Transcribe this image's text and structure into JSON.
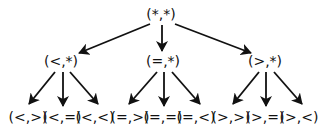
{
  "diagram": {
    "type": "tree",
    "colors": {
      "stroke": "#111111",
      "text": "#111111",
      "background": "#ffffff"
    },
    "nodes": [
      {
        "id": "root",
        "label": "(*,*)",
        "x": 161,
        "y": 15
      },
      {
        "id": "lt",
        "label": "(<,*)",
        "x": 61,
        "y": 62
      },
      {
        "id": "eq",
        "label": "(=,*)",
        "x": 163,
        "y": 62
      },
      {
        "id": "gt",
        "label": "(>,*)",
        "x": 265,
        "y": 62
      },
      {
        "id": "lt_gt",
        "label": "(<,>)",
        "x": 28,
        "y": 118
      },
      {
        "id": "lt_eq",
        "label": "(<,=)",
        "x": 62,
        "y": 118
      },
      {
        "id": "lt_lt",
        "label": "(<,<)",
        "x": 95,
        "y": 118
      },
      {
        "id": "eq_gt",
        "label": "(=,>)",
        "x": 130,
        "y": 118
      },
      {
        "id": "eq_eq",
        "label": "(=,=)",
        "x": 163,
        "y": 118
      },
      {
        "id": "eq_lt",
        "label": "(=,<)",
        "x": 196,
        "y": 118
      },
      {
        "id": "gt_gt",
        "label": "(>,>)",
        "x": 231,
        "y": 118
      },
      {
        "id": "gt_eq",
        "label": "(>,=)",
        "x": 265,
        "y": 118
      },
      {
        "id": "gt_lt",
        "label": "(>,<)",
        "x": 299,
        "y": 118
      }
    ],
    "edges": [
      {
        "from": "root",
        "to": "lt",
        "x1": 150,
        "y1": 24,
        "x2": 79,
        "y2": 53
      },
      {
        "from": "root",
        "to": "eq",
        "x1": 162,
        "y1": 25,
        "x2": 162,
        "y2": 51
      },
      {
        "from": "root",
        "to": "gt",
        "x1": 175,
        "y1": 24,
        "x2": 251,
        "y2": 53
      },
      {
        "from": "lt",
        "to": "lt_gt",
        "x1": 55,
        "y1": 72,
        "x2": 29,
        "y2": 104
      },
      {
        "from": "lt",
        "to": "lt_eq",
        "x1": 63,
        "y1": 72,
        "x2": 63,
        "y2": 106
      },
      {
        "from": "lt",
        "to": "lt_lt",
        "x1": 70,
        "y1": 72,
        "x2": 98,
        "y2": 104
      },
      {
        "from": "eq",
        "to": "eq_gt",
        "x1": 157,
        "y1": 72,
        "x2": 129,
        "y2": 104
      },
      {
        "from": "eq",
        "to": "eq_eq",
        "x1": 164,
        "y1": 72,
        "x2": 164,
        "y2": 106
      },
      {
        "from": "eq",
        "to": "eq_lt",
        "x1": 172,
        "y1": 72,
        "x2": 200,
        "y2": 104
      },
      {
        "from": "gt",
        "to": "gt_gt",
        "x1": 259,
        "y1": 72,
        "x2": 233,
        "y2": 104
      },
      {
        "from": "gt",
        "to": "gt_eq",
        "x1": 266,
        "y1": 72,
        "x2": 266,
        "y2": 106
      },
      {
        "from": "gt",
        "to": "gt_lt",
        "x1": 274,
        "y1": 72,
        "x2": 302,
        "y2": 104
      }
    ]
  }
}
